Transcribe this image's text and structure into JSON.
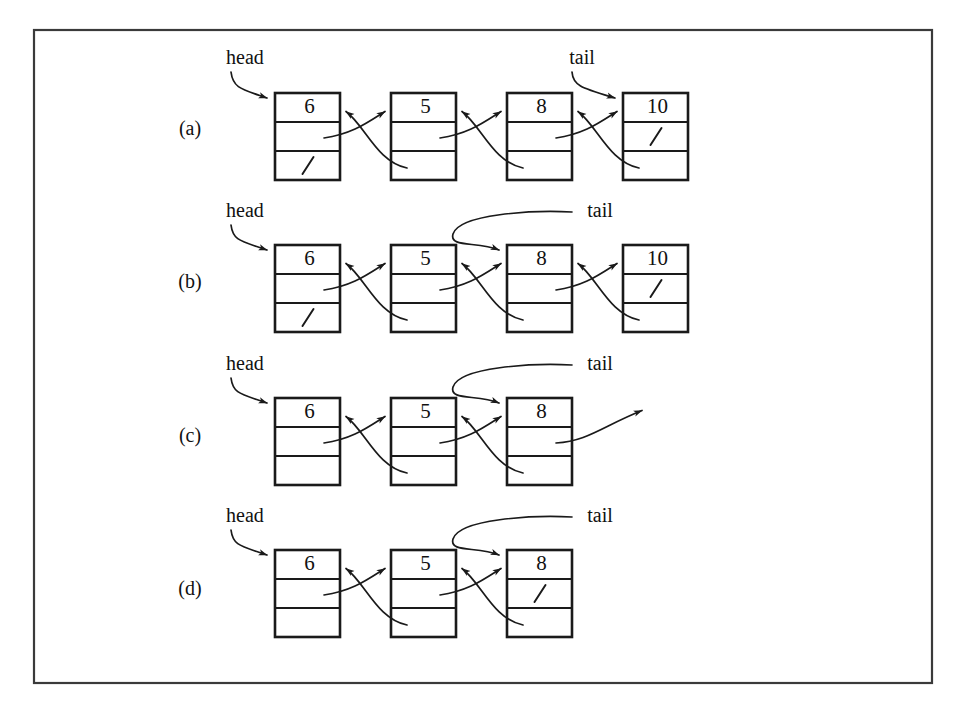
{
  "figure": {
    "frame": {
      "x": 34,
      "y": 30,
      "width": 898,
      "height": 653
    },
    "colors": {
      "ink": "#1a1a1a",
      "frame": "#3a3a3a",
      "background": "#ffffff"
    },
    "null_glyph": "\\",
    "pointer_labels": {
      "head": "head",
      "tail": "tail"
    },
    "rows": [
      {
        "id": "row-a",
        "label": "(a)",
        "label_x": 190,
        "label_y": 130,
        "box_top": 93,
        "head_label": "head",
        "head_label_x": 245,
        "head_label_y": 59,
        "tail_label": "tail",
        "tail_label_x": 582,
        "tail_label_y": 59,
        "tail_style": "short",
        "tail_target_index": 3,
        "nodes": [
          {
            "value": "6",
            "next_is_null": false,
            "prev_is_null": true
          },
          {
            "value": "5",
            "next_is_null": false,
            "prev_is_null": false
          },
          {
            "value": "8",
            "next_is_null": false,
            "prev_is_null": false
          },
          {
            "value": "10",
            "next_is_null": true,
            "prev_is_null": false
          }
        ],
        "dangling_next_from": null
      },
      {
        "id": "row-b",
        "label": "(b)",
        "label_x": 190,
        "label_y": 283,
        "box_top": 245,
        "head_label": "head",
        "head_label_x": 245,
        "head_label_y": 212,
        "tail_label": "tail",
        "tail_label_x": 600,
        "tail_label_y": 212,
        "tail_style": "long",
        "tail_target_index": 2,
        "nodes": [
          {
            "value": "6",
            "next_is_null": false,
            "prev_is_null": true
          },
          {
            "value": "5",
            "next_is_null": false,
            "prev_is_null": false
          },
          {
            "value": "8",
            "next_is_null": false,
            "prev_is_null": false
          },
          {
            "value": "10",
            "next_is_null": true,
            "prev_is_null": false
          }
        ],
        "dangling_next_from": null
      },
      {
        "id": "row-c",
        "label": "(c)",
        "label_x": 190,
        "label_y": 437,
        "box_top": 398,
        "head_label": "head",
        "head_label_x": 245,
        "head_label_y": 365,
        "tail_label": "tail",
        "tail_label_x": 600,
        "tail_label_y": 365,
        "tail_style": "long",
        "tail_target_index": 2,
        "nodes": [
          {
            "value": "6",
            "next_is_null": false,
            "prev_is_null": false
          },
          {
            "value": "5",
            "next_is_null": false,
            "prev_is_null": false
          },
          {
            "value": "8",
            "next_is_null": false,
            "prev_is_null": false
          }
        ],
        "dangling_next_from": 2
      },
      {
        "id": "row-d",
        "label": "(d)",
        "label_x": 190,
        "label_y": 590,
        "box_top": 550,
        "head_label": "head",
        "head_label_x": 245,
        "head_label_y": 517,
        "tail_label": "tail",
        "tail_label_x": 600,
        "tail_label_y": 517,
        "tail_style": "long",
        "tail_target_index": 2,
        "nodes": [
          {
            "value": "6",
            "next_is_null": false,
            "prev_is_null": false
          },
          {
            "value": "5",
            "next_is_null": false,
            "prev_is_null": false
          },
          {
            "value": "8",
            "next_is_null": true,
            "prev_is_null": false
          }
        ],
        "dangling_next_from": null
      }
    ],
    "geometry": {
      "first_box_x": 275,
      "box_width": 65,
      "box_pitch": 116,
      "cell_height": 29
    }
  }
}
